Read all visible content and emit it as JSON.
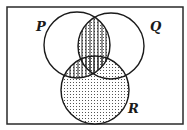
{
  "diagram": {
    "type": "venn",
    "frame": {
      "x": 7,
      "y": 7,
      "width": 176,
      "height": 117,
      "stroke": "#2a2a2a"
    },
    "sets": [
      {
        "name": "P",
        "cx": 77,
        "cy": 45,
        "r": 33,
        "label_x": 36,
        "label_y": 31
      },
      {
        "name": "Q",
        "cx": 111,
        "cy": 46,
        "r": 33,
        "label_x": 150,
        "label_y": 31
      },
      {
        "name": "R",
        "cx": 95,
        "cy": 90,
        "r": 34,
        "label_x": 128,
        "label_y": 113
      }
    ],
    "shading": {
      "P∩Q": "vertical-stripes",
      "P∩R": "vertical-stripes",
      "R": "dots"
    },
    "labels": {
      "p": "P",
      "q": "Q",
      "r": "R"
    },
    "colors": {
      "line": "#1a1a1a",
      "background": "#ffffff",
      "pattern": "#333333"
    }
  }
}
